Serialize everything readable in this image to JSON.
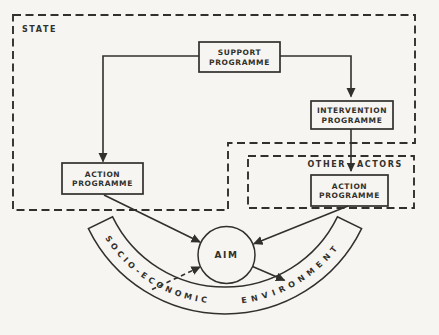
{
  "diagram": {
    "regions": {
      "state": {
        "label": "STATE"
      },
      "other_actors": {
        "label_left": "OTHER",
        "label_right": "ACTORS"
      }
    },
    "boxes": {
      "support": {
        "line1": "SUPPORT",
        "line2": "PROGRAMME"
      },
      "intervention": {
        "line1": "INTERVENTION",
        "line2": "PROGRAMME"
      },
      "action_state": {
        "line1": "ACTION",
        "line2": "PROGRAMME"
      },
      "action_other_actors": {
        "line1": "ACTION",
        "line2": "PROGRAMME"
      }
    },
    "aim": {
      "label": "AIM"
    },
    "environment_band": {
      "text_left": "SOCIO-ECONOMIC",
      "text_right": "ENVIRONMENT"
    },
    "connections": [
      {
        "from": "support-programme",
        "to": "action-programme-state",
        "style": "solid-arrow"
      },
      {
        "from": "support-programme",
        "to": "intervention-programme",
        "style": "solid-arrow"
      },
      {
        "from": "intervention-programme",
        "to": "action-programme-other-actors",
        "style": "solid-arrow"
      },
      {
        "from": "action-programme-state",
        "to": "aim",
        "style": "solid-arrow"
      },
      {
        "from": "action-programme-other-actors",
        "to": "aim",
        "style": "solid-arrow"
      },
      {
        "from": "socio-economic-environment",
        "to": "aim",
        "style": "dashed-arrow"
      },
      {
        "from": "aim",
        "to": "socio-economic-environment",
        "style": "solid-arrow"
      }
    ],
    "colors": {
      "ink": "#32302c",
      "paper": "#f6f5f1"
    }
  }
}
